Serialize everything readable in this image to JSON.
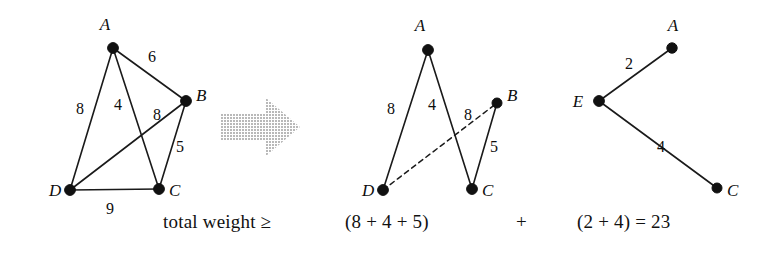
{
  "figure": {
    "kind": "graph-decomposition-diagram",
    "background": "#ffffff",
    "ink_color": "#141414",
    "arrow_color": "#cfcfcf",
    "width": 776,
    "height": 263,
    "panels": [
      {
        "id": "left-graph",
        "name": "original-weighted-graph",
        "nodes": [
          {
            "id": "A",
            "label": "A",
            "x": 113,
            "y": 48,
            "label_x": 105,
            "label_y": 30
          },
          {
            "id": "B",
            "label": "B",
            "x": 186,
            "y": 101,
            "label_x": 196,
            "label_y": 101
          },
          {
            "id": "C",
            "label": "C",
            "x": 159,
            "y": 189,
            "label_x": 169,
            "label_y": 196
          },
          {
            "id": "D",
            "label": "D",
            "x": 70,
            "y": 190,
            "label_x": 49,
            "label_y": 196
          }
        ],
        "edges": [
          {
            "from": "A",
            "to": "B",
            "weight": "6",
            "style": "solid",
            "label_x": 152,
            "label_y": 62
          },
          {
            "from": "A",
            "to": "D",
            "weight": "8",
            "style": "solid",
            "label_x": 80,
            "label_y": 114
          },
          {
            "from": "A",
            "to": "C",
            "weight": "4",
            "style": "solid",
            "label_x": 118,
            "label_y": 110
          },
          {
            "from": "D",
            "to": "B",
            "weight": "8",
            "style": "solid",
            "label_x": 157,
            "label_y": 120
          },
          {
            "from": "B",
            "to": "C",
            "weight": "5",
            "style": "solid",
            "label_x": 180,
            "label_y": 152
          },
          {
            "from": "D",
            "to": "C",
            "weight": "9",
            "style": "solid",
            "label_x": 110,
            "label_y": 214
          }
        ]
      },
      {
        "id": "middle-graph",
        "name": "partial-tree-graph",
        "nodes": [
          {
            "id": "A",
            "label": "A",
            "x": 428,
            "y": 50,
            "label_x": 420,
            "label_y": 31
          },
          {
            "id": "B",
            "label": "B",
            "x": 497,
            "y": 103,
            "label_x": 507,
            "label_y": 101
          },
          {
            "id": "C",
            "label": "C",
            "x": 472,
            "y": 189,
            "label_x": 482,
            "label_y": 196
          },
          {
            "id": "D",
            "label": "D",
            "x": 383,
            "y": 190,
            "label_x": 362,
            "label_y": 196
          }
        ],
        "edges": [
          {
            "from": "A",
            "to": "D",
            "weight": "8",
            "style": "solid",
            "label_x": 391,
            "label_y": 114
          },
          {
            "from": "A",
            "to": "C",
            "weight": "4",
            "style": "solid",
            "label_x": 432,
            "label_y": 110
          },
          {
            "from": "D",
            "to": "B",
            "weight": "8",
            "style": "dashed",
            "label_x": 468,
            "label_y": 120
          },
          {
            "from": "B",
            "to": "C",
            "weight": "5",
            "style": "solid",
            "label_x": 494,
            "label_y": 152
          }
        ]
      },
      {
        "id": "right-graph",
        "name": "extra-vertex-tree-graph",
        "nodes": [
          {
            "id": "A",
            "label": "A",
            "x": 672,
            "y": 48,
            "label_x": 673,
            "label_y": 31
          },
          {
            "id": "E",
            "label": "E",
            "x": 599,
            "y": 101,
            "label_x": 578,
            "label_y": 107
          },
          {
            "id": "C",
            "label": "C",
            "x": 717,
            "y": 188,
            "label_x": 727,
            "label_y": 196
          }
        ],
        "edges": [
          {
            "from": "E",
            "to": "A",
            "weight": "2",
            "style": "solid",
            "label_x": 629,
            "label_y": 69
          },
          {
            "from": "E",
            "to": "C",
            "weight": "4",
            "style": "solid",
            "label_x": 661,
            "label_y": 152
          }
        ]
      }
    ],
    "arrow": {
      "name": "implication-arrow",
      "direction": "right",
      "color": "#cbcbcb"
    },
    "caption": {
      "lead": "total weight ≥",
      "term1": "(8 + 4 + 5)",
      "operator": "+",
      "term2": "(2 + 4) = 23"
    }
  }
}
